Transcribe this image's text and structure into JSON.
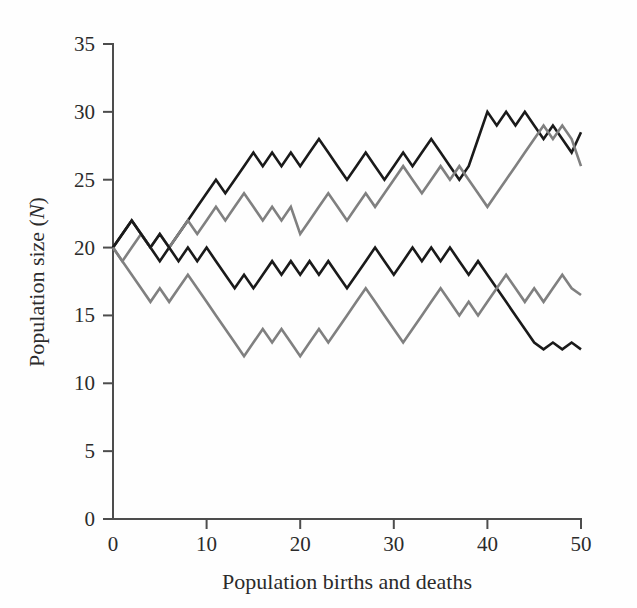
{
  "chart_data": {
    "type": "line",
    "title": "",
    "xlabel": "Population births and deaths",
    "ylabel": "Population size (N)",
    "ylabel_plain": "Population size",
    "ylabel_symbol": "N",
    "xlim": [
      0,
      50
    ],
    "ylim": [
      0,
      35
    ],
    "xticks": [
      0,
      10,
      20,
      30,
      40,
      50
    ],
    "yticks": [
      0,
      5,
      10,
      15,
      20,
      25,
      30,
      35
    ],
    "xtick_labels": [
      "0",
      "10",
      "20",
      "30",
      "40",
      "50"
    ],
    "ytick_labels": [
      "0",
      "5",
      "10",
      "15",
      "20",
      "25",
      "30",
      "35"
    ],
    "grid": false,
    "legend": false,
    "x": [
      0,
      1,
      2,
      3,
      4,
      5,
      6,
      7,
      8,
      9,
      10,
      11,
      12,
      13,
      14,
      15,
      16,
      17,
      18,
      19,
      20,
      21,
      22,
      23,
      24,
      25,
      26,
      27,
      28,
      29,
      30,
      31,
      32,
      33,
      34,
      35,
      36,
      37,
      38,
      39,
      40,
      41,
      42,
      43,
      44,
      45,
      46,
      47,
      48,
      49,
      50
    ],
    "series": [
      {
        "name": "run-1-upper-black",
        "color": "#1a1a1a",
        "values": [
          20,
          21,
          22,
          21,
          20,
          19,
          20,
          21,
          22,
          23,
          24,
          25,
          24,
          25,
          26,
          27,
          26,
          27,
          26,
          27,
          26,
          27,
          28,
          27,
          26,
          25,
          26,
          27,
          26,
          25,
          26,
          27,
          26,
          27,
          28,
          27,
          26,
          25,
          26,
          28,
          30,
          29,
          30,
          29,
          30,
          29,
          28,
          29,
          28,
          27,
          28.5
        ]
      },
      {
        "name": "run-2-upper-gray",
        "color": "#808080",
        "values": [
          20,
          19,
          20,
          21,
          20,
          21,
          20,
          21,
          22,
          21,
          22,
          23,
          22,
          23,
          24,
          23,
          22,
          23,
          22,
          23,
          21,
          22,
          23,
          24,
          23,
          22,
          23,
          24,
          23,
          24,
          25,
          26,
          25,
          24,
          25,
          26,
          25,
          26,
          25,
          24,
          23,
          24,
          25,
          26,
          27,
          28,
          29,
          28,
          29,
          28,
          26
        ]
      },
      {
        "name": "run-3-lower-black",
        "color": "#1a1a1a",
        "values": [
          20,
          21,
          22,
          21,
          20,
          21,
          20,
          19,
          20,
          19,
          20,
          19,
          18,
          17,
          18,
          17,
          18,
          19,
          18,
          19,
          18,
          19,
          18,
          19,
          18,
          17,
          18,
          19,
          20,
          19,
          18,
          19,
          20,
          19,
          20,
          19,
          20,
          19,
          18,
          19,
          18,
          17,
          16,
          15,
          14,
          13,
          12.5,
          13,
          12.5,
          13,
          12.5
        ]
      },
      {
        "name": "run-4-lower-gray",
        "color": "#808080",
        "values": [
          20,
          19,
          18,
          17,
          16,
          17,
          16,
          17,
          18,
          17,
          16,
          15,
          14,
          13,
          12,
          13,
          14,
          13,
          14,
          13,
          12,
          13,
          14,
          13,
          14,
          15,
          16,
          17,
          16,
          15,
          14,
          13,
          14,
          15,
          16,
          17,
          16,
          15,
          16,
          15,
          16,
          17,
          18,
          17,
          16,
          17,
          16,
          17,
          18,
          17,
          16.5
        ]
      }
    ]
  },
  "figure": {
    "background_color": "#fefefe",
    "axis_color": "#4d4d4d",
    "text_color": "#2b2b2b"
  }
}
